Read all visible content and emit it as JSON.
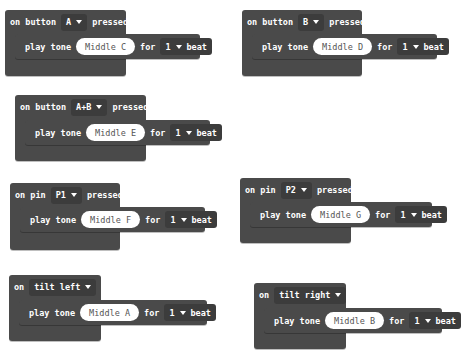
{
  "blocks": [
    {
      "event_words": [
        "on button"
      ],
      "trigger": "A",
      "suffix": "pressed",
      "action": {
        "label": "play tone",
        "note": "Middle C",
        "for_label": "for",
        "beats": "1",
        "beat_label": "beat"
      }
    },
    {
      "event_words": [
        "on button"
      ],
      "trigger": "B",
      "suffix": "pressed",
      "action": {
        "label": "play tone",
        "note": "Middle D",
        "for_label": "for",
        "beats": "1",
        "beat_label": "beat"
      }
    },
    {
      "event_words": [
        "on button"
      ],
      "trigger": "A+B",
      "suffix": "pressed",
      "action": {
        "label": "play tone",
        "note": "Middle E",
        "for_label": "for",
        "beats": "1",
        "beat_label": "beat"
      }
    },
    {
      "event_words": [
        "on pin"
      ],
      "trigger": "P1",
      "suffix": "pressed",
      "action": {
        "label": "play tone",
        "note": "Middle F",
        "for_label": "for",
        "beats": "1",
        "beat_label": "beat"
      }
    },
    {
      "event_words": [
        "on pin"
      ],
      "trigger": "P2",
      "suffix": "pressed",
      "action": {
        "label": "play tone",
        "note": "Middle G",
        "for_label": "for",
        "beats": "1",
        "beat_label": "beat"
      }
    },
    {
      "event_words": [
        "on"
      ],
      "trigger": "tilt left",
      "suffix": "",
      "action": {
        "label": "play tone",
        "note": "Middle A",
        "for_label": "for",
        "beats": "1",
        "beat_label": "beat"
      }
    },
    {
      "event_words": [
        "on"
      ],
      "trigger": "tilt right",
      "suffix": "",
      "action": {
        "label": "play tone",
        "note": "Middle B",
        "for_label": "for",
        "beats": "1",
        "beat_label": "beat"
      }
    }
  ],
  "colors": {
    "block": "#4a4a4a",
    "dropdown": "#3c3c3c",
    "note_pill": "#ffffff",
    "text": "#ffffff"
  },
  "icons": {
    "dropdown": "caret-down-icon"
  }
}
